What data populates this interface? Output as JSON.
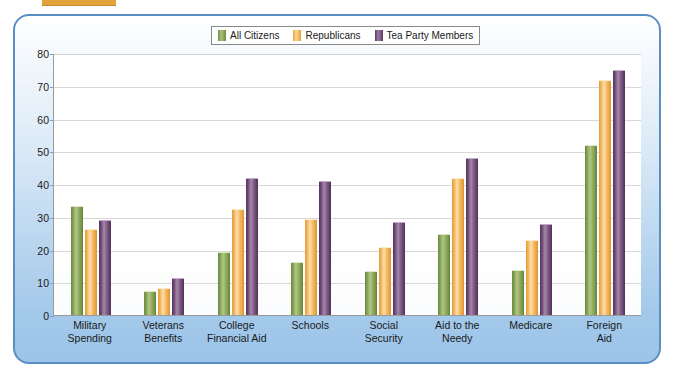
{
  "top_strip": {
    "ghost_text": ""
  },
  "legend": {
    "position": "top-center",
    "entries": [
      {
        "label": "All Citizens",
        "color": "#8ba359",
        "icon": "legend-swatch-green"
      },
      {
        "label": "Republicans",
        "color": "#f5b55a",
        "icon": "legend-swatch-orange"
      },
      {
        "label": "Tea Party Members",
        "color": "#7b5480",
        "icon": "legend-swatch-purple"
      }
    ]
  },
  "axes": {
    "y_ticks": [
      "0",
      "10",
      "20",
      "30",
      "40",
      "50",
      "60",
      "70",
      "80"
    ],
    "x_categories": [
      [
        "Military",
        "Spending"
      ],
      [
        "Veterans",
        "Benefits"
      ],
      [
        "College",
        "Financial Aid"
      ],
      [
        "Schools",
        ""
      ],
      [
        "Social",
        "Security"
      ],
      [
        "Aid to the",
        "Needy"
      ],
      [
        "Medicare",
        ""
      ],
      [
        "Foreign",
        "Aid"
      ]
    ]
  },
  "chart_data": {
    "type": "bar",
    "title": "",
    "subtitle": "",
    "xlabel": "",
    "ylabel": "",
    "ylim": [
      0,
      80
    ],
    "ytick_step": 10,
    "grid": true,
    "legend_position": "top-center",
    "categories": [
      "Military Spending",
      "Veterans Benefits",
      "College Financial Aid",
      "Schools",
      "Social Security",
      "Aid to the Needy",
      "Medicare",
      "Foreign Aid"
    ],
    "series": [
      {
        "name": "All Citizens",
        "color": "#8ba359",
        "values": [
          33,
          7,
          19,
          16,
          13,
          24.5,
          13.5,
          51.5
        ]
      },
      {
        "name": "Republicans",
        "color": "#f5b55a",
        "values": [
          26,
          8,
          32,
          29,
          20.5,
          41.5,
          22.5,
          71.5
        ]
      },
      {
        "name": "Tea Party Members",
        "color": "#7b5480",
        "values": [
          28.8,
          11,
          41.5,
          40.5,
          28,
          47.5,
          27.5,
          74.5
        ]
      }
    ]
  },
  "colors": {
    "panel_border": "#5b8fc4",
    "panel_background_top": "#ffffff",
    "panel_background_bottom": "#9cc4e8",
    "plot_background": "#ffffff",
    "gridline": "#d8d8d8",
    "axis": "#9a9a9a",
    "accent_tab": "#e0a43a"
  }
}
